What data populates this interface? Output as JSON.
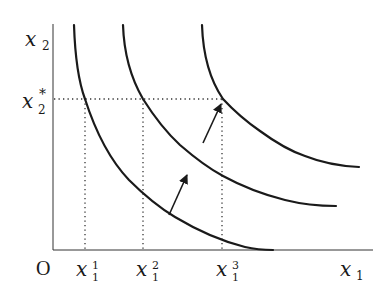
{
  "diagram": {
    "title": "",
    "type": "indifference-curve-map",
    "colors": {
      "curve": "#1a1a1a",
      "axis": "#333333",
      "guide": "#333333",
      "background": "#ffffff"
    },
    "axes": {
      "origin_label": "O",
      "x_label": {
        "base": "x",
        "sub": "1"
      },
      "y_label": {
        "base": "x",
        "sub": "2"
      }
    },
    "y_marker": {
      "base": "x",
      "sub": "2",
      "sup": "*"
    },
    "x_markers": [
      {
        "base": "x",
        "sub": "1",
        "sup": "1"
      },
      {
        "base": "x",
        "sub": "1",
        "sup": "2"
      },
      {
        "base": "x",
        "sub": "1",
        "sup": "3"
      }
    ],
    "curves": [
      {
        "name": "indifference-curve-1"
      },
      {
        "name": "indifference-curve-2"
      },
      {
        "name": "indifference-curve-3"
      }
    ],
    "arrows": [
      {
        "name": "shift-arrow-1-to-2"
      },
      {
        "name": "shift-arrow-2-to-3"
      }
    ]
  }
}
